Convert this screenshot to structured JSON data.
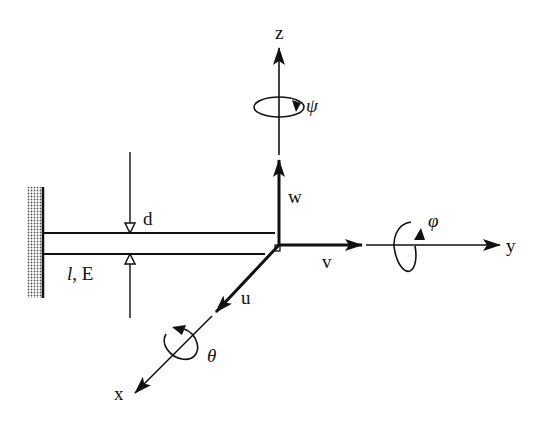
{
  "diagram": {
    "type": "cantilever-beam-coordinate-system",
    "labels": {
      "z_axis": "z",
      "y_axis": "y",
      "x_axis": "x",
      "w_displacement": "w",
      "v_displacement": "v",
      "u_displacement": "u",
      "psi_rotation": "ψ",
      "phi_rotation": "φ",
      "theta_rotation": "θ",
      "thickness": "d",
      "length_modulus_l": "l",
      "length_modulus_rest": ", E"
    },
    "colors": {
      "ink": "#111111",
      "background": "#ffffff",
      "wall_hatch": "#555555"
    }
  }
}
